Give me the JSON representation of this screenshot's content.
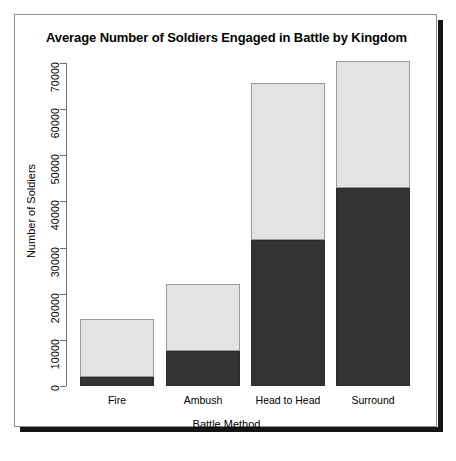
{
  "top_sliver_text": "",
  "colors": {
    "dark_segment": "#333333",
    "light_segment": "#e3e3e3",
    "axis": "#6f6f6f",
    "frame_border": "#8d8d8d",
    "frame_shadow": "#151515",
    "text": "#000000",
    "background": "#ffffff"
  },
  "chart_data": {
    "type": "bar",
    "title": "Average Number of Soldiers Engaged in Battle by Kingdom",
    "xlabel": "Battle Method",
    "ylabel": "Number of Soldiers",
    "stacked": true,
    "grid": false,
    "legend_position": "none",
    "categories": [
      "Fire",
      "Ambush",
      "Head to Head",
      "Surround"
    ],
    "ylim": [
      0,
      70000
    ],
    "yticks": [
      0,
      10000,
      20000,
      30000,
      40000,
      50000,
      60000,
      70000
    ],
    "ytick_labels": [
      "0",
      "10000",
      "20000",
      "30000",
      "40000",
      "50000",
      "60000",
      "70000"
    ],
    "series": [
      {
        "name": "lower-segment",
        "color": "#333333",
        "values": [
          2000,
          7600,
          31600,
          43000
        ]
      },
      {
        "name": "upper-segment",
        "color": "#e3e3e3",
        "values": [
          12500,
          14400,
          34100,
          27500
        ]
      }
    ],
    "totals": [
      14500,
      22000,
      65700,
      70500
    ]
  },
  "layout": {
    "baseline_y": 371,
    "top_y": 48,
    "px_per_unit": 0.0046143,
    "bar_left": [
      65,
      151,
      236,
      321
    ],
    "bar_width": 74
  }
}
